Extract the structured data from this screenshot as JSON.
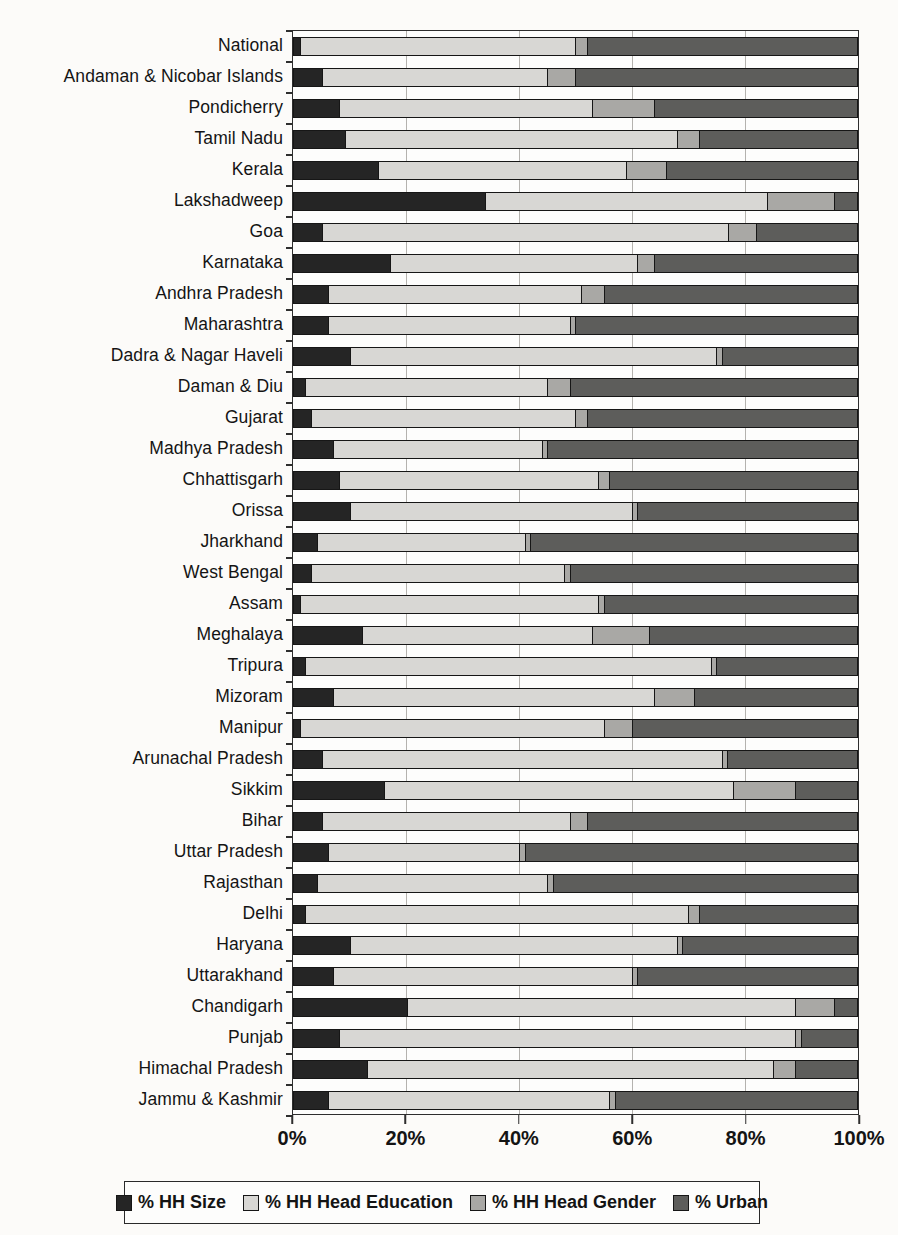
{
  "chart_data": {
    "type": "bar",
    "orientation": "horizontal",
    "stacked": true,
    "title": "",
    "xlabel": "",
    "ylabel": "",
    "xlim": [
      0,
      100
    ],
    "x_ticks": [
      {
        "value": 0,
        "label": "0%"
      },
      {
        "value": 20,
        "label": "20%"
      },
      {
        "value": 40,
        "label": "40%"
      },
      {
        "value": 60,
        "label": "60%"
      },
      {
        "value": 80,
        "label": "80%"
      },
      {
        "value": 100,
        "label": "100%"
      }
    ],
    "gridlines_at": [
      20,
      40,
      60,
      80
    ],
    "legend_position": "bottom",
    "categories": [
      "National",
      "Andaman & Nicobar Islands",
      "Pondicherry",
      "Tamil Nadu",
      "Kerala",
      "Lakshadweep",
      "Goa",
      "Karnataka",
      "Andhra Pradesh",
      "Maharashtra",
      "Dadra & Nagar Haveli",
      "Daman & Diu",
      "Gujarat",
      "Madhya Pradesh",
      "Chhattisgarh",
      "Orissa",
      "Jharkhand",
      "West Bengal",
      "Assam",
      "Meghalaya",
      "Tripura",
      "Mizoram",
      "Manipur",
      "Arunachal Pradesh",
      "Sikkim",
      "Bihar",
      "Uttar Pradesh",
      "Rajasthan",
      "Delhi",
      "Haryana",
      "Uttarakhand",
      "Chandigarh",
      "Punjab",
      "Himachal Pradesh",
      "Jammu & Kashmir"
    ],
    "series": [
      {
        "name": "% HH Size",
        "color": "#252525",
        "values": [
          1,
          5,
          8,
          9,
          15,
          34,
          5,
          17,
          6,
          6,
          10,
          2,
          3,
          7,
          8,
          10,
          4,
          3,
          1,
          12,
          2,
          7,
          1,
          5,
          16,
          5,
          6,
          4,
          2,
          10,
          7,
          20,
          8,
          13,
          6
        ]
      },
      {
        "name": "% HH Head Education",
        "color": "#d8d7d4",
        "values": [
          49,
          40,
          45,
          59,
          44,
          50,
          72,
          44,
          45,
          43,
          65,
          43,
          47,
          37,
          46,
          50,
          37,
          45,
          53,
          41,
          72,
          57,
          54,
          71,
          62,
          44,
          34,
          41,
          68,
          58,
          53,
          69,
          81,
          72,
          50
        ]
      },
      {
        "name": "% HH Head Gender",
        "color": "#a9a8a5",
        "values": [
          2,
          5,
          11,
          4,
          7,
          12,
          5,
          3,
          4,
          1,
          1,
          4,
          2,
          1,
          2,
          1,
          1,
          1,
          1,
          10,
          1,
          7,
          5,
          1,
          11,
          3,
          1,
          1,
          2,
          1,
          1,
          7,
          1,
          4,
          1
        ]
      },
      {
        "name": "% Urban",
        "color": "#5d5d5b",
        "values": [
          48,
          50,
          36,
          28,
          34,
          4,
          18,
          36,
          45,
          50,
          24,
          51,
          48,
          55,
          44,
          39,
          58,
          51,
          45,
          37,
          25,
          29,
          40,
          23,
          11,
          48,
          59,
          54,
          28,
          31,
          39,
          4,
          10,
          11,
          43
        ]
      }
    ]
  },
  "legend": {
    "items": [
      {
        "label": "% HH Size",
        "color": "#252525"
      },
      {
        "label": "% HH Head Education",
        "color": "#d8d7d4"
      },
      {
        "label": "% HH Head Gender",
        "color": "#a9a8a5"
      },
      {
        "label": "% Urban",
        "color": "#5d5d5b"
      }
    ]
  }
}
